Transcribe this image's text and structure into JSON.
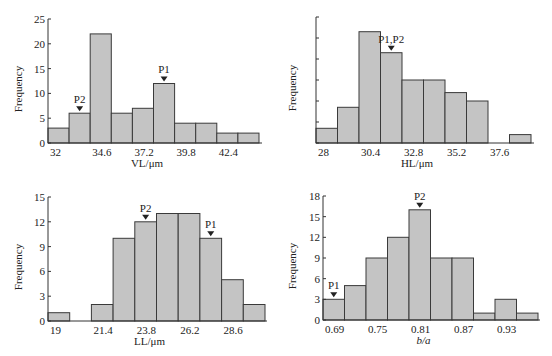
{
  "colors": {
    "bar_fill": "#c4c4c4",
    "bar_stroke": "#3a3a3a",
    "axis": "#333333",
    "marker": "#222222"
  },
  "chart_data": [
    {
      "id": "vl",
      "type": "bar",
      "title": "",
      "xlabel": "VL/μm",
      "ylabel": "Frequency",
      "xlabel_italic": false,
      "ylim": [
        0,
        25
      ],
      "yticks": [
        0,
        5,
        10,
        15,
        20,
        25
      ],
      "ytick_labels": [
        "0",
        "5",
        "10",
        "15",
        "20",
        "25"
      ],
      "xtick_labels": [
        "32",
        "34.6",
        "37.2",
        "39.8",
        "42.4"
      ],
      "xtick_bin_index": [
        0,
        2,
        4,
        6,
        8
      ],
      "bin_start": 32,
      "bin_width": 1.3,
      "values": [
        3,
        6,
        22,
        6,
        7,
        12,
        4,
        4,
        2,
        2
      ],
      "annotations": [
        {
          "label": "P2",
          "bin": 1
        },
        {
          "label": "P1",
          "bin": 5
        }
      ],
      "box": {
        "x0": 48,
        "y0": 19,
        "x1": 262,
        "y1": 143,
        "bar_x0": 48,
        "bar_w": 21.1
      }
    },
    {
      "id": "hl",
      "type": "bar",
      "title": "",
      "xlabel": "HL/μm",
      "ylabel": "Frequency",
      "xlabel_italic": false,
      "ylim": [
        0,
        30
      ],
      "yticks": [
        0,
        5,
        10,
        15,
        20,
        25,
        30
      ],
      "ytick_labels": [
        "",
        "",
        "",
        "",
        "",
        "",
        ""
      ],
      "xtick_labels": [
        "28",
        "30.4",
        "32.8",
        "35.2",
        "37.6"
      ],
      "xtick_bin_index": [
        0,
        2,
        4,
        6,
        8
      ],
      "bin_start": 28,
      "bin_width": 1.2,
      "values": [
        3.5,
        8.5,
        26.5,
        21.5,
        15,
        15,
        12,
        10,
        0,
        2
      ],
      "annotations": [
        {
          "label": "P1,P2",
          "bin": 3
        }
      ],
      "box": {
        "x0": 316,
        "y0": 17,
        "x1": 534,
        "y1": 143,
        "bar_x0": 316,
        "bar_w": 21.5
      }
    },
    {
      "id": "ll",
      "type": "bar",
      "title": "",
      "xlabel": "LL/μm",
      "ylabel": "Frequency",
      "xlabel_italic": false,
      "ylim": [
        0,
        15
      ],
      "yticks": [
        0,
        3,
        6,
        9,
        12,
        15
      ],
      "ytick_labels": [
        "0",
        "3",
        "6",
        "9",
        "12",
        "15"
      ],
      "xtick_labels": [
        "19",
        "21.4",
        "23.8",
        "26.2",
        "28.6"
      ],
      "xtick_bin_index": [
        0,
        2,
        4,
        6,
        8
      ],
      "bin_start": 19,
      "bin_width": 1.2,
      "values": [
        1,
        0,
        2,
        10,
        12,
        13,
        13,
        10,
        5,
        2
      ],
      "annotations": [
        {
          "label": "P2",
          "bin": 4
        },
        {
          "label": "P1",
          "bin": 7
        }
      ],
      "box": {
        "x0": 48,
        "y0": 197,
        "x1": 267,
        "y1": 321,
        "bar_x0": 48,
        "bar_w": 21.7
      }
    },
    {
      "id": "ba",
      "type": "bar",
      "title": "",
      "xlabel": "b/a",
      "ylabel": "Frequency",
      "xlabel_italic": true,
      "ylim": [
        0,
        18
      ],
      "yticks": [
        0,
        3,
        6,
        9,
        12,
        15,
        18
      ],
      "ytick_labels": [
        "0",
        "3",
        "6",
        "9",
        "12",
        "15",
        "18"
      ],
      "xtick_labels": [
        "0.69",
        "0.75",
        "0.81",
        "0.87",
        "0.93"
      ],
      "xtick_bin_index": [
        0,
        2,
        4,
        6,
        8
      ],
      "bin_start": 0.69,
      "bin_width": 0.03,
      "values": [
        3,
        5,
        9,
        12,
        16,
        9,
        9,
        1,
        3,
        1
      ],
      "annotations": [
        {
          "label": "P1",
          "bin": 0
        },
        {
          "label": "P2",
          "bin": 4
        }
      ],
      "box": {
        "x0": 323,
        "y0": 196,
        "x1": 540,
        "y1": 320,
        "bar_x0": 323,
        "bar_w": 21.5
      }
    }
  ]
}
